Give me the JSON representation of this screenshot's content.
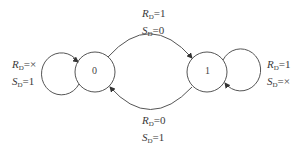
{
  "diagram": {
    "type": "state-transition",
    "states": [
      {
        "id": "s0",
        "label": "0"
      },
      {
        "id": "s1",
        "label": "1"
      }
    ],
    "transitions": [
      {
        "from": "0",
        "to": "0",
        "kind": "self-loop",
        "lines": [
          {
            "var": "R",
            "sub": "D",
            "value": "=×"
          },
          {
            "var": "S",
            "sub": "D",
            "value": "=1"
          }
        ]
      },
      {
        "from": "0",
        "to": "1",
        "kind": "arc-top",
        "lines": [
          {
            "var": "R",
            "sub": "D",
            "value": "=1"
          },
          {
            "var": "S",
            "sub": "D",
            "value": "=0"
          }
        ]
      },
      {
        "from": "1",
        "to": "0",
        "kind": "arc-bottom",
        "lines": [
          {
            "var": "R",
            "sub": "D",
            "value": "=0"
          },
          {
            "var": "S",
            "sub": "D",
            "value": "=1"
          }
        ]
      },
      {
        "from": "1",
        "to": "1",
        "kind": "self-loop",
        "lines": [
          {
            "var": "R",
            "sub": "D",
            "value": "=1"
          },
          {
            "var": "S",
            "sub": "D",
            "value": "=×"
          }
        ]
      }
    ],
    "colors": {
      "stroke": "#444444",
      "text": "#3a3a3a",
      "background": "#ffffff"
    }
  }
}
